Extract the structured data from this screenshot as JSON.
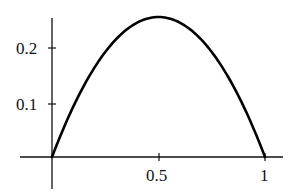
{
  "chart_data": {
    "type": "line",
    "title": "",
    "xlabel": "",
    "ylabel": "",
    "function": "y = x(1 - x)",
    "xlim": [
      0,
      1
    ],
    "ylim": [
      0,
      0.25
    ],
    "grid": false,
    "legend": null,
    "x_ticks": [
      0.5,
      1
    ],
    "x_tick_labels": [
      "0.5",
      "1"
    ],
    "y_ticks": [
      0.1,
      0.2
    ],
    "y_tick_labels": [
      "0.1",
      "0.2"
    ],
    "series": [
      {
        "name": "curve",
        "color": "#000000",
        "x": [
          0,
          0.1,
          0.2,
          0.3,
          0.4,
          0.5,
          0.6,
          0.7,
          0.8,
          0.9,
          1
        ],
        "y": [
          0,
          0.09,
          0.16,
          0.21,
          0.24,
          0.25,
          0.24,
          0.21,
          0.16,
          0.09,
          0
        ]
      }
    ]
  },
  "labels": {
    "y01": "0.1",
    "y02": "0.2",
    "x05": "0.5",
    "x1": "1"
  }
}
